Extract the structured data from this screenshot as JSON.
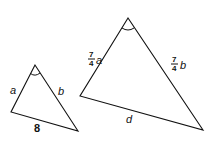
{
  "diagram": {
    "small_triangle": {
      "vertices": {
        "top": [
          35,
          65
        ],
        "left": [
          11,
          112
        ],
        "right": [
          78,
          131
        ]
      },
      "labels": {
        "left_side": "a",
        "right_side": "b",
        "bottom_side": "8"
      }
    },
    "large_triangle": {
      "vertices": {
        "top": [
          128,
          18
        ],
        "left": [
          80,
          96
        ],
        "right": [
          203,
          130
        ]
      },
      "labels": {
        "left_side": {
          "num": "7",
          "den": "4",
          "var": "a"
        },
        "right_side": {
          "num": "7",
          "den": "4",
          "var": "b"
        },
        "bottom_side": "d"
      }
    },
    "stroke_color": "#111111"
  }
}
